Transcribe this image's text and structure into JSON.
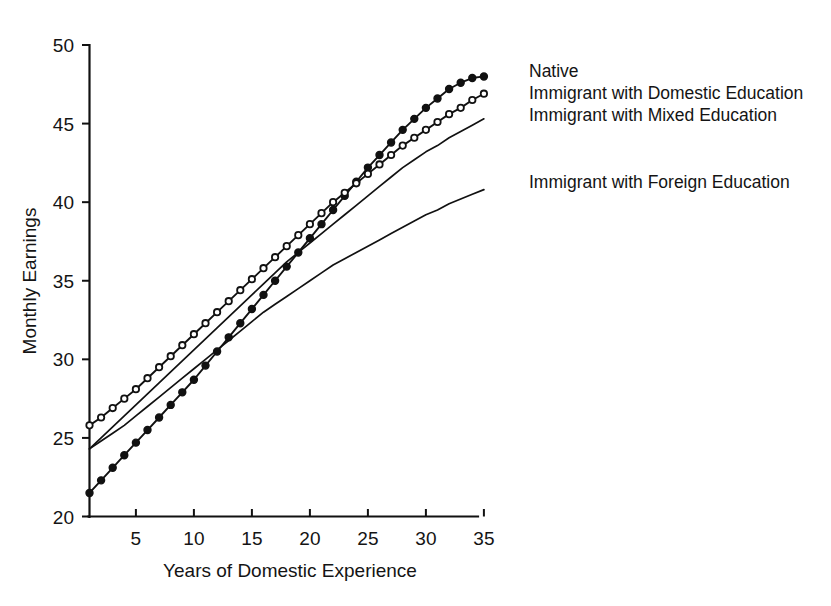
{
  "chart": {
    "type": "line",
    "xlabel": "Years of Domestic Experience",
    "ylabel": "Monthly Earnings",
    "x_ticks": [
      "5",
      "10",
      "15",
      "20",
      "25",
      "30",
      "35"
    ],
    "y_ticks": [
      "20",
      "25",
      "30",
      "35",
      "40",
      "45",
      "50"
    ]
  },
  "legend": {
    "native": "Native",
    "domestic": "Immigrant with Domestic Education",
    "mixed": "Immigrant with Mixed Education",
    "foreign": "Immigrant with Foreign Education"
  },
  "chart_data": {
    "type": "line",
    "title": "",
    "xlabel": "Years of Domestic Experience",
    "ylabel": "Monthly Earnings",
    "xlim": [
      1,
      35
    ],
    "ylim": [
      20,
      50
    ],
    "xticks": [
      5,
      10,
      15,
      20,
      25,
      30,
      35
    ],
    "yticks": [
      20,
      25,
      30,
      35,
      40,
      45,
      50
    ],
    "grid": false,
    "legend_position": "right",
    "x": [
      1,
      2,
      3,
      4,
      5,
      6,
      7,
      8,
      9,
      10,
      11,
      12,
      13,
      14,
      15,
      16,
      17,
      18,
      19,
      20,
      21,
      22,
      23,
      24,
      25,
      26,
      27,
      28,
      29,
      30,
      31,
      32,
      33,
      34,
      35
    ],
    "series": [
      {
        "name": "Native",
        "marker": "filled-circle",
        "line": "solid",
        "values": [
          21.5,
          22.3,
          23.1,
          23.9,
          24.7,
          25.5,
          26.3,
          27.1,
          27.9,
          28.7,
          29.6,
          30.5,
          31.4,
          32.3,
          33.2,
          34.1,
          35.0,
          35.9,
          36.8,
          37.7,
          38.6,
          39.5,
          40.4,
          41.3,
          42.2,
          43.0,
          43.8,
          44.6,
          45.3,
          46.0,
          46.6,
          47.2,
          47.6,
          47.9,
          48.0
        ]
      },
      {
        "name": "Immigrant with Domestic Education",
        "marker": "open-circle",
        "line": "solid",
        "values": [
          25.8,
          26.3,
          26.9,
          27.5,
          28.1,
          28.8,
          29.5,
          30.2,
          30.9,
          31.6,
          32.3,
          33.0,
          33.7,
          34.4,
          35.1,
          35.8,
          36.5,
          37.2,
          37.9,
          38.6,
          39.3,
          40.0,
          40.6,
          41.2,
          41.8,
          42.4,
          43.0,
          43.6,
          44.1,
          44.6,
          45.1,
          45.6,
          46.0,
          46.5,
          46.9
        ]
      },
      {
        "name": "Immigrant with Mixed Education",
        "marker": "none",
        "line": "solid",
        "values": [
          24.3,
          25.0,
          25.7,
          26.4,
          27.1,
          27.8,
          28.5,
          29.2,
          29.9,
          30.6,
          31.3,
          32.0,
          32.7,
          33.4,
          34.1,
          34.8,
          35.5,
          36.2,
          36.8,
          37.4,
          38.0,
          38.6,
          39.2,
          39.8,
          40.4,
          41.0,
          41.6,
          42.2,
          42.7,
          43.2,
          43.6,
          44.1,
          44.5,
          44.9,
          45.3
        ]
      },
      {
        "name": "Immigrant with Foreign Education",
        "marker": "none",
        "line": "solid",
        "values": [
          24.3,
          24.8,
          25.3,
          25.8,
          26.4,
          27.0,
          27.6,
          28.2,
          28.8,
          29.4,
          30.0,
          30.6,
          31.2,
          31.8,
          32.4,
          33.0,
          33.5,
          34.0,
          34.5,
          35.0,
          35.5,
          36.0,
          36.4,
          36.8,
          37.2,
          37.6,
          38.0,
          38.4,
          38.8,
          39.2,
          39.5,
          39.9,
          40.2,
          40.5,
          40.8
        ]
      }
    ]
  }
}
